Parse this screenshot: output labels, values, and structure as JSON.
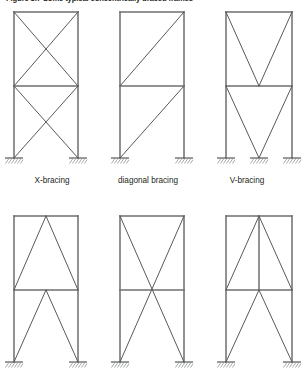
{
  "figure": {
    "caption": "Figure 3.7  Some typical concentrically braced frames",
    "width": 302,
    "height": 378,
    "line_color": "#6d6e71",
    "brace_color": "#58595b",
    "text_color": "#231f20",
    "background": "#ffffff"
  },
  "labels": {
    "x_bracing": "X-bracing",
    "diagonal_bracing": "diagonal bracing",
    "v_bracing": "V-bracing"
  },
  "frames": [
    {
      "id": "frame-x-bracing",
      "label": "X-bracing",
      "row": 1,
      "column": 1,
      "stories": 2,
      "bracing_type": "x",
      "bays": 1,
      "supports": 2,
      "geometry": {
        "left": 14,
        "right": 78,
        "top": 12,
        "mid": 86,
        "base": 158
      }
    },
    {
      "id": "frame-diagonal-bracing",
      "label": "diagonal bracing",
      "row": 1,
      "column": 2,
      "stories": 2,
      "bracing_type": "diagonal",
      "bays": 1,
      "supports": 2,
      "geometry": {
        "left": 120,
        "right": 184,
        "top": 12,
        "mid": 86,
        "base": 158
      }
    },
    {
      "id": "frame-v-bracing",
      "label": "V-bracing",
      "row": 1,
      "column": 3,
      "stories": 2,
      "bracing_type": "v",
      "bays": 2,
      "supports": 3,
      "geometry": {
        "left": 226,
        "right": 292,
        "top": 12,
        "mid": 86,
        "base": 158
      }
    },
    {
      "id": "frame-inverted-v-bracing",
      "label": "",
      "row": 2,
      "column": 1,
      "stories": 2,
      "bracing_type": "inverted-v",
      "bays": 1,
      "supports": 2,
      "geometry": {
        "left": 14,
        "right": 78,
        "top": 216,
        "mid": 290,
        "base": 362
      }
    },
    {
      "id": "frame-two-story-x-bracing",
      "label": "",
      "row": 2,
      "column": 2,
      "stories": 2,
      "bracing_type": "two-story-x",
      "bays": 1,
      "supports": 2,
      "geometry": {
        "left": 120,
        "right": 184,
        "top": 216,
        "mid": 290,
        "base": 362
      }
    },
    {
      "id": "frame-inverted-v-with-center-column",
      "label": "",
      "row": 2,
      "column": 3,
      "stories": 2,
      "bracing_type": "inverted-v-center-column",
      "bays": 2,
      "supports": 3,
      "geometry": {
        "left": 226,
        "right": 292,
        "top": 216,
        "mid": 290,
        "base": 362
      }
    }
  ],
  "icons": {
    "support": "fixed-support-hatched-icon"
  }
}
